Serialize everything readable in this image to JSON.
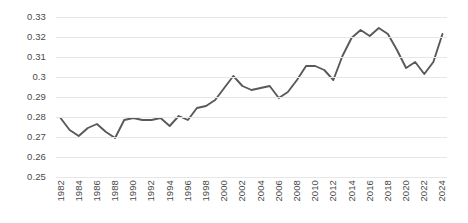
{
  "chart_data": {
    "type": "line",
    "title": "",
    "xlabel": "",
    "ylabel": "",
    "ylim": [
      0.25,
      0.33
    ],
    "ytick_step": 0.01,
    "ytick_labels": [
      "0.33",
      "0.32",
      "0.31",
      "0.3",
      "0.29",
      "0.28",
      "0.27",
      "0.26",
      "0.25"
    ],
    "ytick_values": [
      0.33,
      0.32,
      0.31,
      0.3,
      0.29,
      0.28,
      0.27,
      0.26,
      0.25
    ],
    "grid": true,
    "legend": false,
    "legend_position": "none",
    "line_color": "#595959",
    "grid_color": "#e6e6e6",
    "background_color": "#ffffff",
    "x": [
      1982,
      1983,
      1984,
      1985,
      1986,
      1987,
      1988,
      1989,
      1990,
      1991,
      1992,
      1993,
      1994,
      1995,
      1996,
      1997,
      1998,
      1999,
      2000,
      2001,
      2002,
      2003,
      2004,
      2005,
      2006,
      2007,
      2008,
      2009,
      2010,
      2011,
      2012,
      2013,
      2014,
      2015,
      2016,
      2017,
      2018,
      2019,
      2020,
      2021,
      2022,
      2023,
      2024
    ],
    "xtick_labels": [
      "1982",
      "1984",
      "1986",
      "1988",
      "1990",
      "1992",
      "1994",
      "1996",
      "1998",
      "2000",
      "2002",
      "2004",
      "2006",
      "2008",
      "2010",
      "2012",
      "2014",
      "2016",
      "2018",
      "2020",
      "2022",
      "2024"
    ],
    "xtick_values": [
      1982,
      1984,
      1986,
      1988,
      1990,
      1992,
      1994,
      1996,
      1998,
      2000,
      2002,
      2004,
      2006,
      2008,
      2010,
      2012,
      2014,
      2016,
      2018,
      2020,
      2022,
      2024
    ],
    "values": [
      0.2795,
      0.2735,
      0.2705,
      0.2745,
      0.2765,
      0.2725,
      0.2695,
      0.2785,
      0.2795,
      0.2785,
      0.2785,
      0.2795,
      0.2755,
      0.2805,
      0.2785,
      0.2845,
      0.2855,
      0.2885,
      0.2945,
      0.3005,
      0.2955,
      0.2935,
      0.2945,
      0.2955,
      0.2895,
      0.2925,
      0.2985,
      0.3055,
      0.3055,
      0.3035,
      0.2985,
      0.3105,
      0.3195,
      0.3235,
      0.3205,
      0.3245,
      0.3215,
      0.3135,
      0.3045,
      0.3075,
      0.3015,
      0.3075,
      0.3215
    ],
    "series_name": ""
  }
}
